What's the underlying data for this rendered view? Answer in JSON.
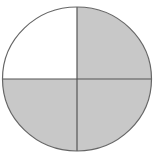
{
  "diagram": {
    "type": "fraction-circle",
    "total_parts": 4,
    "shaded_parts": 3,
    "quadrants": [
      {
        "position": "top-left",
        "shaded": false
      },
      {
        "position": "top-right",
        "shaded": true
      },
      {
        "position": "bottom-left",
        "shaded": true
      },
      {
        "position": "bottom-right",
        "shaded": true
      }
    ],
    "colors": {
      "shaded_fill": "#c8c8c8",
      "unshaded_fill": "#ffffff",
      "stroke": "#555555",
      "background": "#ffffff"
    }
  }
}
